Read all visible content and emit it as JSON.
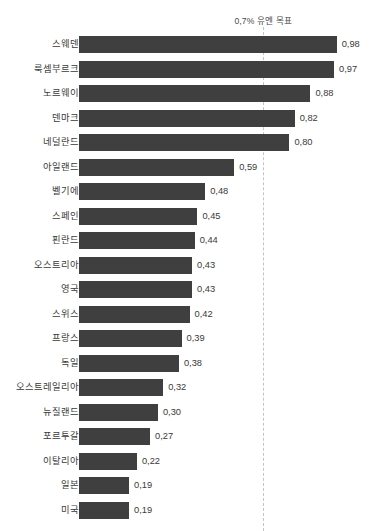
{
  "annotation": {
    "text": "0,7% 유엔 목표",
    "value": 0.7
  },
  "style": {
    "bar_color": "#3f3f3f",
    "target_line_color": "#c4c4c4",
    "text_color": "#3a3a3a",
    "background": "#ffffff"
  },
  "chart_data": {
    "type": "bar",
    "orientation": "horizontal",
    "title": "",
    "subtitle": "",
    "xlabel": "",
    "ylabel": "",
    "xlim": [
      0,
      1.0
    ],
    "grid": false,
    "legend": null,
    "decimal_separator": ",",
    "annotations": [
      {
        "text": "0,7% 유엔 목표",
        "x": 0.7,
        "type": "vertical-dashed-line"
      }
    ],
    "categories": [
      "스웨덴",
      "룩셈부르크",
      "노르웨이",
      "덴마크",
      "네덜란드",
      "아일랜드",
      "벨기에",
      "스페인",
      "핀란드",
      "오스트리아",
      "영국",
      "스위스",
      "프랑스",
      "독일",
      "오스트레일리아",
      "뉴질랜드",
      "포르투갈",
      "이탈리아",
      "일본",
      "미국"
    ],
    "values": [
      0.98,
      0.97,
      0.88,
      0.82,
      0.8,
      0.59,
      0.48,
      0.45,
      0.44,
      0.43,
      0.43,
      0.42,
      0.39,
      0.38,
      0.32,
      0.3,
      0.27,
      0.22,
      0.19,
      0.19
    ],
    "value_labels": [
      "0,98",
      "0,97",
      "0,88",
      "0,82",
      "0,80",
      "0,59",
      "0,48",
      "0,45",
      "0,44",
      "0,43",
      "0,43",
      "0,42",
      "0,39",
      "0,38",
      "0,32",
      "0,30",
      "0,27",
      "0,22",
      "0,19",
      "0,19"
    ]
  }
}
